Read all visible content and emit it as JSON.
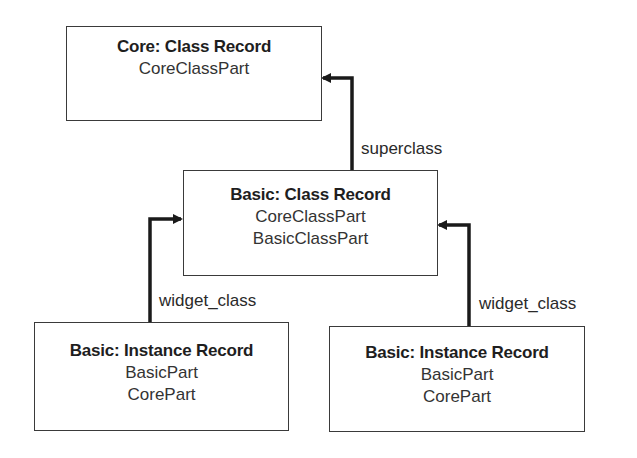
{
  "diagram": {
    "nodes": [
      {
        "id": "core_class_record",
        "title": "Core: Class Record",
        "parts": [
          "CoreClassPart"
        ]
      },
      {
        "id": "basic_class_record",
        "title": "Basic: Class Record",
        "parts": [
          "CoreClassPart",
          "BasicClassPart"
        ]
      },
      {
        "id": "basic_instance_record_left",
        "title": "Basic: Instance Record",
        "parts": [
          "BasicPart",
          "CorePart"
        ]
      },
      {
        "id": "basic_instance_record_right",
        "title": "Basic: Instance Record",
        "parts": [
          "BasicPart",
          "CorePart"
        ]
      }
    ],
    "edges": [
      {
        "from": "basic_class_record",
        "to": "core_class_record",
        "label": "superclass"
      },
      {
        "from": "basic_instance_record_left",
        "to": "basic_class_record",
        "label": "widget_class"
      },
      {
        "from": "basic_instance_record_right",
        "to": "basic_class_record",
        "label": "widget_class"
      }
    ]
  }
}
